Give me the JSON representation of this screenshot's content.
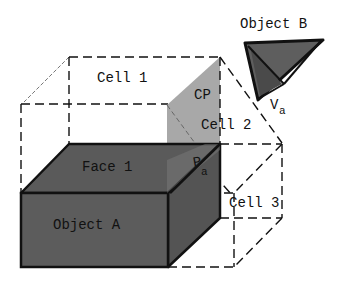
{
  "diagram": {
    "labels": {
      "cell1": "Cell 1",
      "cell2": "Cell 2",
      "cell3": "Cell 3",
      "cp": "CP",
      "face1": "Face 1",
      "object_a": "Object A",
      "object_b": "Object B",
      "va_main": "V",
      "va_sub": "a",
      "pa_main": "P",
      "pa_sub": "a"
    },
    "colors": {
      "object_fill": "#5c5c5c",
      "object_top_fill": "#5a5a5a",
      "cp_fill": "#a8a8a8",
      "stroke": "#111111",
      "background": "#ffffff"
    }
  }
}
